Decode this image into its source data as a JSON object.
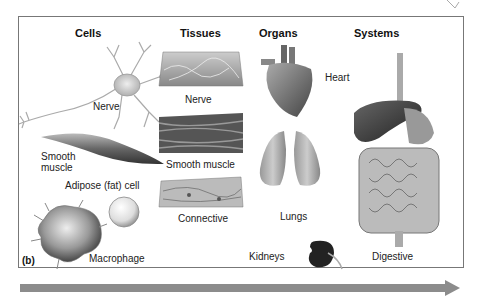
{
  "figure_label": "(b)",
  "columns": [
    {
      "title": "Cells"
    },
    {
      "title": "Tissues"
    },
    {
      "title": "Organs"
    },
    {
      "title": "Systems"
    }
  ],
  "cells": {
    "nerve": "Nerve",
    "smooth_muscle_line1": "Smooth",
    "smooth_muscle_line2": "muscle",
    "adipose": "Adipose (fat) cell",
    "macrophage": "Macrophage"
  },
  "tissues": {
    "nerve": "Nerve",
    "smooth_muscle": "Smooth muscle",
    "connective": "Connective"
  },
  "organs": {
    "heart": "Heart",
    "lungs": "Lungs",
    "kidneys": "Kidneys"
  },
  "systems": {
    "digestive": "Digestive"
  },
  "colors": {
    "frame": "#777777",
    "arrow": "#8c8c8c",
    "organ_dark": "#3a3a3a",
    "organ_mid": "#8a8a8a",
    "cell_light": "#d8d8d8"
  }
}
